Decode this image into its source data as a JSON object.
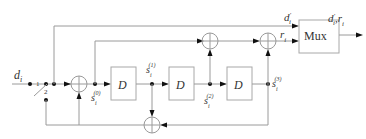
{
  "diagram": {
    "input_label": "d",
    "input_sub": "i",
    "switch": {
      "pos1": "1",
      "pos2": "2"
    },
    "delays": [
      {
        "label": "D"
      },
      {
        "label": "D"
      },
      {
        "label": "D"
      }
    ],
    "states": [
      {
        "base": "s",
        "sub": "i",
        "sup": "(0)"
      },
      {
        "base": "s",
        "sub": "i",
        "sup": "(1)"
      },
      {
        "base": "s",
        "sub": "i",
        "sup": "(2)"
      },
      {
        "base": "s",
        "sub": "i",
        "sup": "(3)"
      }
    ],
    "top_signal": {
      "base": "d",
      "prime": "'",
      "sub": "i"
    },
    "parity_signal": {
      "base": "r",
      "sub": "i"
    },
    "mux_label": "Mux",
    "output_label": {
      "base": "d",
      "prime": "'",
      "sub": "i",
      "sep": ",",
      "base2": "r",
      "sub2": "i"
    }
  }
}
